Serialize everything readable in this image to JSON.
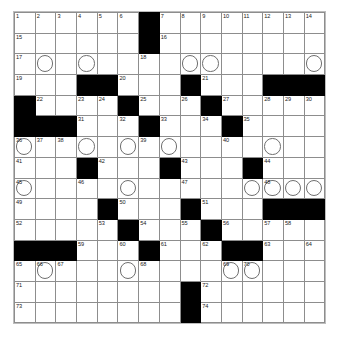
{
  "puzzle": {
    "title": "Crossword Grid",
    "rows": 15,
    "cols": 15,
    "cell_size_px": 21,
    "colors": {
      "block_fill": "#000000",
      "grid_line": "#8d8d8d",
      "cell_fill": "#ffffff",
      "number_text": "#1a1a1a",
      "circle_stroke": "#6f6f6f"
    },
    "total_numbered_clues": 74,
    "legend": {
      "black_square": "block",
      "circled_cell": "circle"
    },
    "grid": [
      [
        {
          "type": "cell",
          "number": "1"
        },
        {
          "type": "cell",
          "number": "2"
        },
        {
          "type": "cell",
          "number": "3"
        },
        {
          "type": "cell",
          "number": "4"
        },
        {
          "type": "cell",
          "number": "5"
        },
        {
          "type": "cell",
          "number": "6"
        },
        {
          "type": "block"
        },
        {
          "type": "cell",
          "number": "7"
        },
        {
          "type": "cell",
          "number": "8"
        },
        {
          "type": "cell",
          "number": "9"
        },
        {
          "type": "cell",
          "number": "10"
        },
        {
          "type": "cell",
          "number": "11"
        },
        {
          "type": "cell",
          "number": "12"
        },
        {
          "type": "cell",
          "number": "13"
        },
        {
          "type": "cell",
          "number": "14"
        }
      ],
      [
        {
          "type": "cell",
          "number": "15"
        },
        {
          "type": "cell"
        },
        {
          "type": "cell"
        },
        {
          "type": "cell"
        },
        {
          "type": "cell"
        },
        {
          "type": "cell"
        },
        {
          "type": "block"
        },
        {
          "type": "cell",
          "number": "16"
        },
        {
          "type": "cell"
        },
        {
          "type": "cell"
        },
        {
          "type": "cell"
        },
        {
          "type": "cell"
        },
        {
          "type": "cell"
        },
        {
          "type": "cell"
        },
        {
          "type": "cell"
        }
      ],
      [
        {
          "type": "cell",
          "number": "17"
        },
        {
          "type": "cell",
          "circle": true
        },
        {
          "type": "cell"
        },
        {
          "type": "cell",
          "circle": true
        },
        {
          "type": "cell"
        },
        {
          "type": "cell"
        },
        {
          "type": "cell",
          "number": "18"
        },
        {
          "type": "cell"
        },
        {
          "type": "cell",
          "circle": true
        },
        {
          "type": "cell",
          "circle": true
        },
        {
          "type": "cell"
        },
        {
          "type": "cell"
        },
        {
          "type": "cell"
        },
        {
          "type": "cell"
        },
        {
          "type": "cell",
          "circle": true
        }
      ],
      [
        {
          "type": "cell",
          "number": "19"
        },
        {
          "type": "cell"
        },
        {
          "type": "cell"
        },
        {
          "type": "block"
        },
        {
          "type": "block"
        },
        {
          "type": "cell",
          "number": "20"
        },
        {
          "type": "cell"
        },
        {
          "type": "cell"
        },
        {
          "type": "block"
        },
        {
          "type": "cell",
          "number": "21"
        },
        {
          "type": "cell"
        },
        {
          "type": "cell"
        },
        {
          "type": "block"
        },
        {
          "type": "block"
        },
        {
          "type": "block"
        }
      ],
      [
        {
          "type": "block"
        },
        {
          "type": "cell",
          "number": "22"
        },
        {
          "type": "cell"
        },
        {
          "type": "cell",
          "number": "23"
        },
        {
          "type": "cell",
          "number": "24"
        },
        {
          "type": "block"
        },
        {
          "type": "cell",
          "number": "25"
        },
        {
          "type": "cell"
        },
        {
          "type": "cell",
          "number": "26"
        },
        {
          "type": "block"
        },
        {
          "type": "cell",
          "number": "27"
        },
        {
          "type": "cell"
        },
        {
          "type": "cell",
          "number": "28"
        },
        {
          "type": "cell",
          "number": "29"
        },
        {
          "type": "cell",
          "number": "30"
        }
      ],
      [
        {
          "type": "block"
        },
        {
          "type": "block"
        },
        {
          "type": "block"
        },
        {
          "type": "cell",
          "number": "31"
        },
        {
          "type": "cell"
        },
        {
          "type": "cell",
          "number": "32"
        },
        {
          "type": "block"
        },
        {
          "type": "cell",
          "number": "33"
        },
        {
          "type": "cell"
        },
        {
          "type": "cell",
          "number": "34"
        },
        {
          "type": "block"
        },
        {
          "type": "cell",
          "number": "35"
        },
        {
          "type": "cell"
        },
        {
          "type": "cell"
        },
        {
          "type": "cell"
        }
      ],
      [
        {
          "type": "cell",
          "number": "36",
          "circle": true
        },
        {
          "type": "cell",
          "number": "37"
        },
        {
          "type": "cell",
          "number": "38"
        },
        {
          "type": "cell",
          "circle": true
        },
        {
          "type": "cell"
        },
        {
          "type": "cell",
          "circle": true
        },
        {
          "type": "cell",
          "number": "39"
        },
        {
          "type": "cell",
          "circle": true
        },
        {
          "type": "cell"
        },
        {
          "type": "cell"
        },
        {
          "type": "cell",
          "number": "40"
        },
        {
          "type": "cell"
        },
        {
          "type": "cell",
          "circle": true
        },
        {
          "type": "cell"
        },
        {
          "type": "cell"
        }
      ],
      [
        {
          "type": "cell",
          "number": "41"
        },
        {
          "type": "cell"
        },
        {
          "type": "cell"
        },
        {
          "type": "block"
        },
        {
          "type": "cell",
          "number": "42"
        },
        {
          "type": "cell"
        },
        {
          "type": "cell"
        },
        {
          "type": "block"
        },
        {
          "type": "cell",
          "number": "43"
        },
        {
          "type": "cell"
        },
        {
          "type": "cell"
        },
        {
          "type": "block"
        },
        {
          "type": "cell",
          "number": "44"
        },
        {
          "type": "cell"
        },
        {
          "type": "cell"
        }
      ],
      [
        {
          "type": "cell",
          "number": "45",
          "circle": true
        },
        {
          "type": "cell"
        },
        {
          "type": "cell"
        },
        {
          "type": "cell",
          "number": "46"
        },
        {
          "type": "cell"
        },
        {
          "type": "cell",
          "circle": true
        },
        {
          "type": "cell"
        },
        {
          "type": "cell"
        },
        {
          "type": "cell",
          "number": "47"
        },
        {
          "type": "cell"
        },
        {
          "type": "cell"
        },
        {
          "type": "cell",
          "circle": true
        },
        {
          "type": "cell",
          "number": "48",
          "circle": true
        },
        {
          "type": "cell",
          "circle": true
        },
        {
          "type": "cell",
          "circle": true
        }
      ],
      [
        {
          "type": "cell",
          "number": "49"
        },
        {
          "type": "cell"
        },
        {
          "type": "cell"
        },
        {
          "type": "cell"
        },
        {
          "type": "block"
        },
        {
          "type": "cell",
          "number": "50"
        },
        {
          "type": "cell"
        },
        {
          "type": "cell"
        },
        {
          "type": "block"
        },
        {
          "type": "cell",
          "number": "51"
        },
        {
          "type": "cell"
        },
        {
          "type": "cell"
        },
        {
          "type": "block"
        },
        {
          "type": "block"
        },
        {
          "type": "block"
        }
      ],
      [
        {
          "type": "cell",
          "number": "52"
        },
        {
          "type": "cell"
        },
        {
          "type": "cell"
        },
        {
          "type": "cell"
        },
        {
          "type": "cell",
          "number": "53"
        },
        {
          "type": "block"
        },
        {
          "type": "cell",
          "number": "54"
        },
        {
          "type": "cell"
        },
        {
          "type": "cell",
          "number": "55"
        },
        {
          "type": "block"
        },
        {
          "type": "cell",
          "number": "56"
        },
        {
          "type": "cell"
        },
        {
          "type": "cell",
          "number": "57"
        },
        {
          "type": "cell",
          "number": "58"
        },
        {
          "type": "cell"
        }
      ],
      [
        {
          "type": "block"
        },
        {
          "type": "block"
        },
        {
          "type": "block"
        },
        {
          "type": "cell",
          "number": "59"
        },
        {
          "type": "cell"
        },
        {
          "type": "cell",
          "number": "60"
        },
        {
          "type": "block"
        },
        {
          "type": "cell",
          "number": "61"
        },
        {
          "type": "cell"
        },
        {
          "type": "cell",
          "number": "62"
        },
        {
          "type": "block"
        },
        {
          "type": "block"
        },
        {
          "type": "cell",
          "number": "63"
        },
        {
          "type": "cell"
        },
        {
          "type": "cell",
          "number": "64"
        }
      ],
      [
        {
          "type": "cell",
          "number": "65"
        },
        {
          "type": "cell",
          "number": "66",
          "circle": true
        },
        {
          "type": "cell",
          "number": "67"
        },
        {
          "type": "cell"
        },
        {
          "type": "cell"
        },
        {
          "type": "cell",
          "circle": true
        },
        {
          "type": "cell",
          "number": "68"
        },
        {
          "type": "cell"
        },
        {
          "type": "cell"
        },
        {
          "type": "cell"
        },
        {
          "type": "cell",
          "number": "69",
          "circle": true
        },
        {
          "type": "cell",
          "number": "70",
          "circle": true
        },
        {
          "type": "cell"
        },
        {
          "type": "cell"
        },
        {
          "type": "cell"
        }
      ],
      [
        {
          "type": "cell",
          "number": "71"
        },
        {
          "type": "cell"
        },
        {
          "type": "cell"
        },
        {
          "type": "cell"
        },
        {
          "type": "cell"
        },
        {
          "type": "cell"
        },
        {
          "type": "cell"
        },
        {
          "type": "cell"
        },
        {
          "type": "block"
        },
        {
          "type": "cell",
          "number": "72"
        },
        {
          "type": "cell"
        },
        {
          "type": "cell"
        },
        {
          "type": "cell"
        },
        {
          "type": "cell"
        },
        {
          "type": "cell"
        }
      ],
      [
        {
          "type": "cell",
          "number": "73"
        },
        {
          "type": "cell"
        },
        {
          "type": "cell"
        },
        {
          "type": "cell"
        },
        {
          "type": "cell"
        },
        {
          "type": "cell"
        },
        {
          "type": "cell"
        },
        {
          "type": "cell"
        },
        {
          "type": "block"
        },
        {
          "type": "cell",
          "number": "74"
        },
        {
          "type": "cell"
        },
        {
          "type": "cell"
        },
        {
          "type": "cell"
        },
        {
          "type": "cell"
        },
        {
          "type": "cell"
        }
      ]
    ]
  }
}
